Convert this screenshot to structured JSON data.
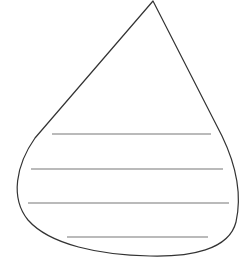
{
  "figure": {
    "background": "#ffffff",
    "outline_color": "#333333",
    "line_color": "#777777",
    "shape": "teardrop",
    "lines": [
      {
        "x1": 52,
        "x2": 211,
        "y": 134
      },
      {
        "x1": 31,
        "x2": 223,
        "y": 169
      },
      {
        "x1": 28,
        "x2": 229,
        "y": 203
      },
      {
        "x1": 67,
        "x2": 208,
        "y": 237
      }
    ]
  }
}
